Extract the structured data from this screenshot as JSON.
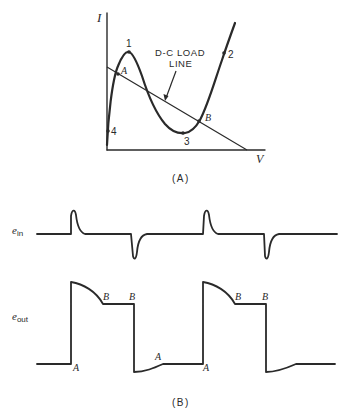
{
  "figure_a": {
    "caption": "(A)",
    "y_axis_label": "I",
    "x_axis_label": "V",
    "load_line_label_line1": "D-C LOAD",
    "load_line_label_line2": "LINE",
    "points": {
      "p1": "1",
      "p2": "2",
      "p3": "3",
      "p4": "4",
      "a": "A",
      "b": "B"
    }
  },
  "figure_b": {
    "caption": "(B)",
    "input_label_main": "e",
    "input_label_sub": "in",
    "output_label_main": "e",
    "output_label_sub": "out",
    "markers": {
      "a1": "A",
      "b1": "B",
      "b2": "B",
      "a2": "A",
      "a3": "A",
      "b3": "B",
      "b4": "B"
    }
  },
  "colors": {
    "ink": "#2a2a2a",
    "background": "#ffffff"
  }
}
